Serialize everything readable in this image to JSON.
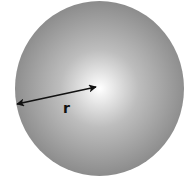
{
  "diagram": {
    "shape": "sphere",
    "center": [
      99.5,
      88.5
    ],
    "radius_x": 84.5,
    "radius_y": 87.5,
    "fill_center_color": "#ffffff",
    "fill_mid_color": "#bdbdbd",
    "fill_edge_color": "#8c8c8c",
    "radius_arrow": {
      "from": [
        17,
        104
      ],
      "to": [
        96,
        87
      ],
      "color": "#111111",
      "label": "r",
      "label_position": [
        63,
        113
      ]
    }
  }
}
